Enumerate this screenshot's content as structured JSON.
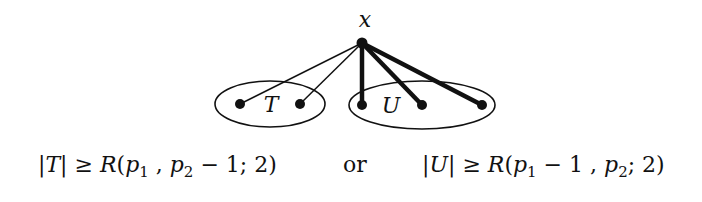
{
  "diagram": {
    "apex": {
      "label": "x",
      "cx": 362,
      "cy": 43,
      "label_x": 365,
      "label_y": 27
    },
    "sets": [
      {
        "name": "T",
        "label": "T",
        "cx": 270,
        "cy": 104,
        "rx": 55,
        "ry": 23,
        "label_x": 270,
        "label_y": 112,
        "nodes": [
          {
            "cx": 240,
            "cy": 104
          },
          {
            "cx": 300,
            "cy": 104
          }
        ]
      },
      {
        "name": "U",
        "label": "U",
        "cx": 422,
        "cy": 105,
        "rx": 73,
        "ry": 24,
        "label_x": 390,
        "label_y": 113,
        "nodes": [
          {
            "cx": 362,
            "cy": 105
          },
          {
            "cx": 422,
            "cy": 105
          },
          {
            "cx": 482,
            "cy": 105
          }
        ]
      }
    ],
    "edges": [
      {
        "to": [
          240,
          104
        ],
        "style": "thin"
      },
      {
        "to": [
          300,
          104
        ],
        "style": "thin"
      },
      {
        "to": [
          362,
          105
        ],
        "style": "thick"
      },
      {
        "to": [
          422,
          105
        ],
        "style": "thick"
      },
      {
        "to": [
          482,
          105
        ],
        "style": "thick"
      }
    ],
    "colors": {
      "stroke": "#111111",
      "node": "#111111",
      "background": "#ffffff"
    }
  },
  "caption": {
    "left": {
      "abs_open": "|",
      "var": "T",
      "abs_close": "|",
      "geq": " ≥ ",
      "R": "R",
      "paren_open": "(",
      "p1": "p",
      "sub1": "1",
      "comma": " , ",
      "p2": "p",
      "sub2": "2",
      "minus_one": " − 1",
      "semi": "; 2",
      "paren_close": ")"
    },
    "connector": "or",
    "right": {
      "abs_open": "|",
      "var": "U",
      "abs_close": "|",
      "geq": " ≥ ",
      "R": "R",
      "paren_open": "(",
      "p1": "p",
      "sub1": "1",
      "minus_one": " − 1",
      "comma": " , ",
      "p2": "p",
      "sub2": "2",
      "semi": "; 2",
      "paren_close": ")"
    }
  }
}
